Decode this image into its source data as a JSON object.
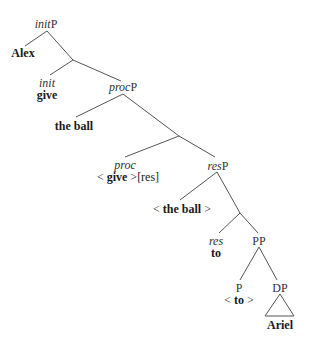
{
  "tree": {
    "nodes": {
      "initP": {
        "head": "init",
        "suffix": "P"
      },
      "alex": {
        "word": "Alex"
      },
      "init": {
        "cat": "init",
        "word": "give"
      },
      "procP": {
        "head": "proc",
        "suffix": "P"
      },
      "the_ball": {
        "word": "the ball"
      },
      "proc": {
        "cat": "proc",
        "open": "< ",
        "word": "give",
        "close": " >",
        "extra": "[res]"
      },
      "resP": {
        "head": "res",
        "suffix": "P"
      },
      "the_ball_trace": {
        "open": "< ",
        "word": "the ball",
        "close": " >"
      },
      "res": {
        "cat": "res",
        "word": "to"
      },
      "PP": {
        "label": "PP"
      },
      "P": {
        "label": "P",
        "open": "< ",
        "word": "to",
        "close": " >"
      },
      "DP": {
        "label": "DP",
        "word": "Ariel"
      }
    },
    "colors": {
      "line": "#555555",
      "text": "#1a1a1a"
    }
  }
}
